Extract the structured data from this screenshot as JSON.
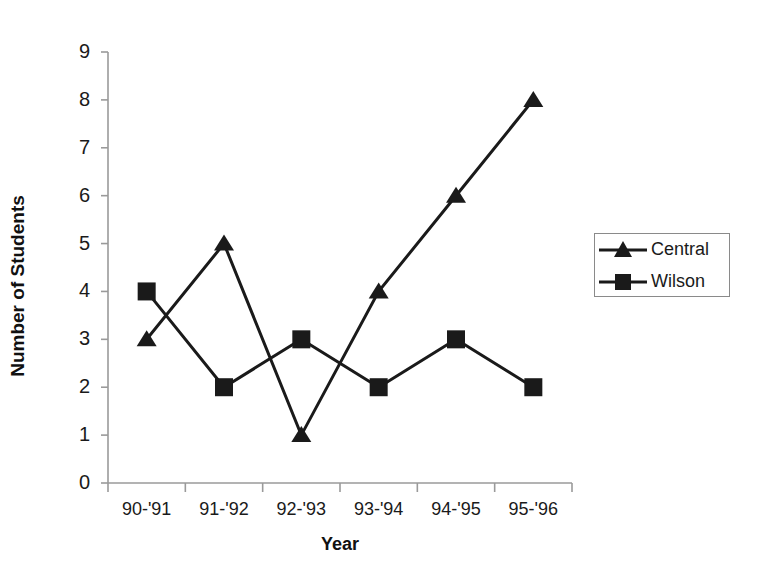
{
  "chart_data": {
    "type": "line",
    "title": "",
    "xlabel": "Year",
    "ylabel": "Number of Students",
    "categories": [
      "90-'91",
      "91-'92",
      "92-'93",
      "93-'94",
      "94-'95",
      "95-'96"
    ],
    "series": [
      {
        "name": "Central",
        "marker": "triangle",
        "color": "#1a1a1a",
        "values": [
          3,
          5,
          1,
          4,
          6,
          8
        ]
      },
      {
        "name": "Wilson",
        "marker": "square",
        "color": "#1a1a1a",
        "values": [
          4,
          2,
          3,
          2,
          3,
          2
        ]
      }
    ],
    "ylim": [
      0,
      9
    ],
    "ytick_labels": [
      "0",
      "1",
      "2",
      "3",
      "4",
      "5",
      "6",
      "7",
      "8",
      "9"
    ],
    "grid": false,
    "legend_position": "right"
  },
  "axes": {
    "y_title": "Number of Students",
    "x_title": "Year"
  },
  "legend": {
    "entries": [
      {
        "label": "Central"
      },
      {
        "label": "Wilson"
      }
    ]
  }
}
